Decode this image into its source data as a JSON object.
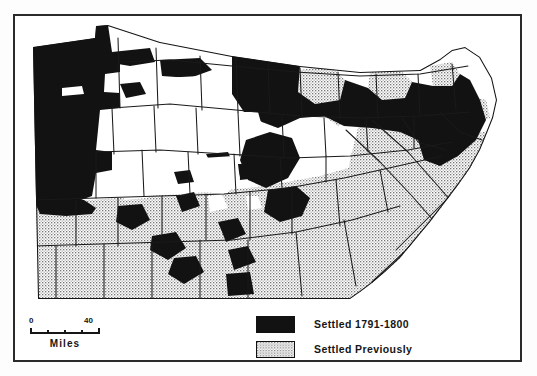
{
  "figure": {
    "type": "thematic-choropleth-map",
    "region": "Pennsylvania",
    "frame_visible": true
  },
  "legend": {
    "items": [
      {
        "swatch": "solid-black",
        "label": "Settled 1791-1800",
        "color": "#121212"
      },
      {
        "swatch": "stipple-gray",
        "label": "Settled Previously",
        "color": "#e2e2e2"
      }
    ]
  },
  "scale": {
    "min_label": "0",
    "max_label": "40",
    "units_label": "Miles",
    "segments": 4
  },
  "map_data": {
    "type": "choropleth",
    "classes": [
      {
        "name": "Settled 1791-1800",
        "fill": "#121212"
      },
      {
        "name": "Settled Previously",
        "fill": "#e2e2e2"
      },
      {
        "name": "Unsettled",
        "fill": "#ffffff"
      }
    ],
    "notes": "Black shading concentrated in the northwest, north-central and northeast; stippled gray covers the south and southeast; white interior counties remain unsettled."
  }
}
